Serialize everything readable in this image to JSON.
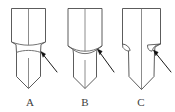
{
  "figure": {
    "caption_labels": [
      "A",
      "B",
      "C"
    ],
    "annotation_count": 3,
    "line_color": "#4a4a4a",
    "arrow_color": "#111111",
    "background_color": "#ffffff",
    "label_color": "#3d3d3d"
  },
  "panels": [
    {
      "id": "panel-a",
      "label": "A",
      "label_x": 30,
      "label_y": 106,
      "description": "tool-tip-profile-a",
      "shank": {
        "left": 11.5,
        "right": 45.5,
        "top": 8.5,
        "bottom": 42.0,
        "centerline_x": 28.5
      },
      "body_path": "M 11.5 8.5 L 45.5 8.5 L 45.5 42.0 L 41.0 44.5 L 40.5 52.5 L 40.5 76.5 L 28.5 88.5 L 16.5 76.5 L 16.5 52.5 L 16.0 44.5 L 11.5 42.0 Z",
      "neck_path": "M 11.5 42.0 C 17.0 44.0 22.5 45.2 28.5 45.2 C 34.5 45.2 40.0 44.0 45.5 42.0",
      "shoulder_path": "M 16.0 52.5 C 20.5 51.0 24.5 50.4 28.5 50.4 C 32.5 50.4 36.5 51.0 41.0 52.5",
      "centerline_top_path": "M 28.5 8.5 L 28.5 45.2",
      "centerline_tip_path": "M 28.5 58.0 L 28.5 88.5",
      "notches": [],
      "arrow": {
        "shaft": "M 57.0 72.0 L 41.5 52.5",
        "head": "M 41.0 51.5 L 45.6 54.0 L 43.0 57.3 Z"
      }
    },
    {
      "id": "panel-b",
      "label": "B",
      "label_x": 85,
      "label_y": 106,
      "description": "tool-tip-profile-b",
      "shank": {
        "left": 68.0,
        "right": 102.0,
        "top": 8.5,
        "bottom": 46.0,
        "centerline_x": 85.0
      },
      "body_path": "M 68.0 8.5 L 102.0 8.5 L 102.0 46.0 L 97.0 49.5 L 96.5 54.0 L 96.5 77.0 L 85.0 88.5 L 73.5 77.0 L 73.5 54.0 L 73.0 49.5 L 68.0 46.0 Z",
      "neck_path": "M 68.0 46.0 C 73.5 49.6 79.0 51.2 85.0 51.2 C 91.0 51.2 96.5 49.6 102.0 46.0",
      "shoulder_path": "M 73.0 49.5 C 77.0 52.4 81.0 53.6 85.0 53.6 C 89.0 53.6 93.0 52.4 97.0 49.5",
      "centerline_top_path": "M 85.0 8.5 L 85.0 51.2",
      "centerline_tip_path": "M 85.0 60.0 L 85.0 88.5",
      "notches": [],
      "arrow": {
        "shaft": "M 114.0 72.0 L 98.0 50.0",
        "head": "M 97.5 49.0 L 102.2 51.3 L 99.8 54.8 Z"
      }
    },
    {
      "id": "panel-c",
      "label": "C",
      "label_x": 141,
      "label_y": 106,
      "description": "tool-tip-profile-c",
      "shank": {
        "left": 122.5,
        "right": 160.5,
        "top": 8.5,
        "bottom": 44.0,
        "centerline_x": 141.5
      },
      "body_path": "M 122.5 8.5 L 160.5 8.5 L 160.5 44.0 L 155.0 47.0 L 154.5 52.0 L 154.0 76.5 L 141.5 89.5 L 129.0 76.5 L 128.5 52.0 L 128.0 47.0 L 122.5 44.0 Z",
      "neck_path": "",
      "shoulder_path": "",
      "centerline_top_path": "M 141.5 8.5 L 141.5 47.0",
      "centerline_tip_path": "M 141.5 47.0 L 141.5 89.5",
      "notches": [
        "M 122.5 44.0 C 126.5 44.4 129.0 46.6 130.2 50.4 C 127.8 51.8 124.8 50.0 122.8 47.4 Z",
        "M 160.5 44.0 C 156.2 44.4 153.2 47.0 152.0 51.2 C 148.8 51.0 147.2 48.4 147.6 45.0 Z"
      ],
      "arrow": {
        "shaft": "M 171.0 72.0 L 154.0 51.0",
        "head": "M 153.4 50.0 L 158.2 52.2 L 155.8 55.8 Z"
      }
    }
  ]
}
